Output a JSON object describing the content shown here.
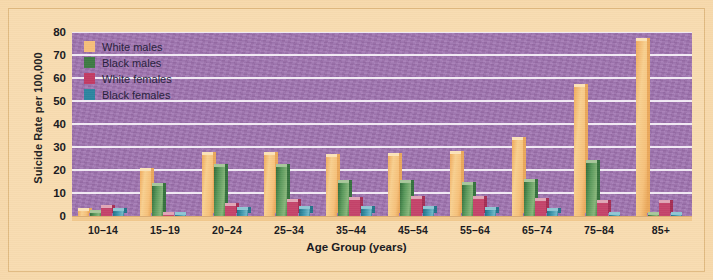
{
  "chart_data": {
    "type": "bar",
    "title": "",
    "xlabel": "Age Group (years)",
    "ylabel": "Suicide Rate per 100,000",
    "categories": [
      "10–14",
      "15–19",
      "20–24",
      "25–34",
      "35–44",
      "45–54",
      "55–64",
      "65–74",
      "75–84",
      "85+"
    ],
    "ylim": [
      0,
      80
    ],
    "yticks": [
      0,
      10,
      20,
      30,
      40,
      50,
      60,
      70,
      80
    ],
    "grid": true,
    "legend_position": "top-left",
    "series": [
      {
        "name": "White males",
        "color": "#f6be79",
        "values": [
          2.0,
          19.5,
          26.5,
          26.5,
          25.5,
          26.0,
          27.0,
          33.0,
          56.0,
          76.0
        ]
      },
      {
        "name": "Black males",
        "color": "#3d7a43",
        "values": [
          1.5,
          13.0,
          21.5,
          21.5,
          14.5,
          14.5,
          13.5,
          15.0,
          23.0,
          0.0
        ]
      },
      {
        "name": "White females",
        "color": "#c23a63",
        "values": [
          3.5,
          0.5,
          4.5,
          6.0,
          7.0,
          7.5,
          7.5,
          6.5,
          5.5,
          5.5
        ]
      },
      {
        "name": "Black females",
        "color": "#2b85a0",
        "values": [
          2.0,
          0.5,
          2.5,
          3.0,
          3.0,
          3.0,
          2.5,
          2.0,
          0.5,
          0.5
        ]
      }
    ]
  },
  "legend": {
    "items": [
      {
        "label": "White males",
        "swatch": "white-males-swatch"
      },
      {
        "label": "Black males",
        "swatch": "black-males-swatch"
      },
      {
        "label": "White females",
        "swatch": "white-females-swatch"
      },
      {
        "label": "Black females",
        "swatch": "black-females-swatch"
      }
    ]
  },
  "colors": {
    "page_background": "#f7d9ab",
    "plot_background": "#9f72b0",
    "gridline": "#f2eaf5",
    "text": "#17171c"
  }
}
